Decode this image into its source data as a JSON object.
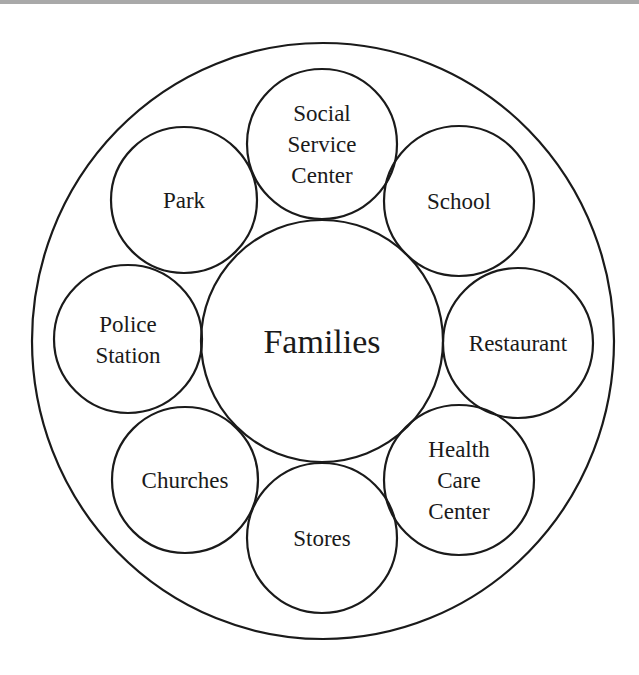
{
  "diagram": {
    "outer_boundary": {
      "cx": 323,
      "cy": 341,
      "rx": 291,
      "ry": 298
    },
    "center": {
      "label": "Families",
      "cx": 322,
      "cy": 341,
      "r": 121,
      "font_size": 34
    },
    "nodes": [
      {
        "id": "social-service-center",
        "lines": [
          "Social",
          "Service",
          "Center"
        ],
        "cx": 322,
        "cy": 144,
        "r": 75
      },
      {
        "id": "school",
        "lines": [
          "School"
        ],
        "cx": 459,
        "cy": 201,
        "r": 75
      },
      {
        "id": "restaurant",
        "lines": [
          "Restaurant"
        ],
        "cx": 518,
        "cy": 343,
        "r": 75
      },
      {
        "id": "health-care-center",
        "lines": [
          "Health",
          "Care",
          "Center"
        ],
        "cx": 459,
        "cy": 480,
        "r": 75
      },
      {
        "id": "stores",
        "lines": [
          "Stores"
        ],
        "cx": 322,
        "cy": 538,
        "r": 75
      },
      {
        "id": "churches",
        "lines": [
          "Churches"
        ],
        "cx": 185,
        "cy": 480,
        "r": 73
      },
      {
        "id": "police-station",
        "lines": [
          "Police",
          "Station"
        ],
        "cx": 128,
        "cy": 339,
        "r": 74
      },
      {
        "id": "park",
        "lines": [
          "Park"
        ],
        "cx": 184,
        "cy": 200,
        "r": 73
      }
    ],
    "node_font_size": 23,
    "line_height": 31,
    "colors": {
      "stroke": "#1a1a1a",
      "text": "#1a1a1a",
      "background": "#ffffff",
      "top_bar": "#a9a9a9"
    }
  }
}
